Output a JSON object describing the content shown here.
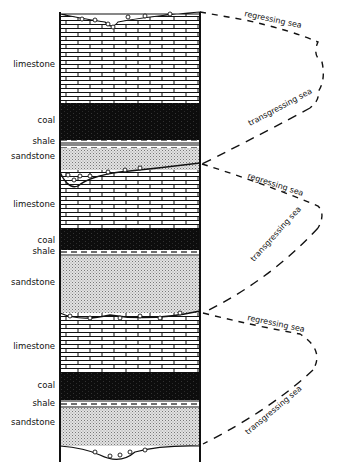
{
  "colors": {
    "ink": "#111111",
    "coal": "#0d0d0d",
    "sandstone_fill": "#d9d9d9",
    "background": "#ffffff"
  },
  "layers": [
    {
      "rock": "limestone",
      "label": "limestone"
    },
    {
      "rock": "coal",
      "label": "coal"
    },
    {
      "rock": "shale",
      "label": "shale"
    },
    {
      "rock": "sandstone",
      "label": "sandstone"
    },
    {
      "rock": "limestone",
      "label": "limestone"
    },
    {
      "rock": "coal",
      "label": "coal"
    },
    {
      "rock": "shale",
      "label": "shale"
    },
    {
      "rock": "sandstone",
      "label": "sandstone"
    },
    {
      "rock": "limestone",
      "label": "limestone"
    },
    {
      "rock": "coal",
      "label": "coal"
    },
    {
      "rock": "shale",
      "label": "shale"
    },
    {
      "rock": "sandstone",
      "label": "sandstone"
    }
  ],
  "sea_labels": [
    {
      "text": "regressing sea"
    },
    {
      "text": "transgressing sea"
    },
    {
      "text": "regressing sea"
    },
    {
      "text": "transgressing sea"
    },
    {
      "text": "regressing sea"
    },
    {
      "text": "transgressing sea"
    }
  ]
}
